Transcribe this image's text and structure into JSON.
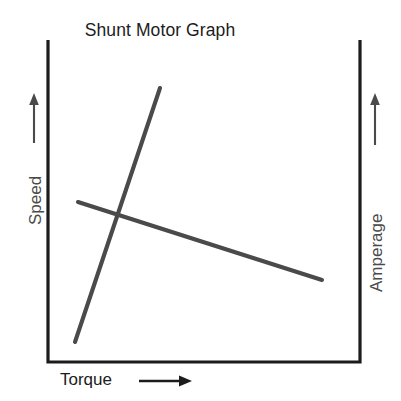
{
  "chart_data": {
    "type": "line",
    "title": "Shunt Motor Graph",
    "xlabel": "Torque",
    "ylabel": "Speed",
    "y2label": "Amperage",
    "grid": false,
    "legend": "none",
    "axis_arrows": {
      "x_arrow": "right-arrow-icon",
      "y_left_arrow": "up-arrow-icon",
      "y_right_arrow": "up-arrow-icon"
    },
    "xlim": [
      0,
      1
    ],
    "ylim": [
      0,
      1
    ],
    "axis_ticks": {
      "x": [],
      "y": [],
      "y2": []
    },
    "line_color": "#4a4a4a",
    "axis_color": "#1c1c1c",
    "series": [
      {
        "name": "Speed",
        "axis": "left",
        "description": "Speed decreases slightly as torque increases",
        "x": [
          0.096,
          1.0
        ],
        "y": [
          0.497,
          0.255
        ],
        "points_px": [
          [
            78,
            202
          ],
          [
            322,
            280
          ]
        ]
      },
      {
        "name": "Amperage",
        "axis": "right",
        "description": "Amperage increases steeply as torque increases",
        "x": [
          0.0865,
          0.4387
        ],
        "y": [
          0.0621,
          0.8509
        ],
        "points_px": [
          [
            75,
            342
          ],
          [
            160,
            88
          ]
        ]
      }
    ],
    "intersection_px": [
      118,
      212
    ]
  },
  "geometry": {
    "frame": {
      "left_x": 48,
      "right_x": 360,
      "top_y": 40,
      "bottom_y": 362,
      "stroke_width": 3.2
    },
    "arrows": {
      "left_up": {
        "x": 34,
        "y_top": 95,
        "y_bottom": 143
      },
      "right_up": {
        "x": 375,
        "y_top": 95,
        "y_bottom": 145
      },
      "bottom_right": {
        "y": 381,
        "x_start": 139,
        "x_end": 191
      }
    }
  }
}
